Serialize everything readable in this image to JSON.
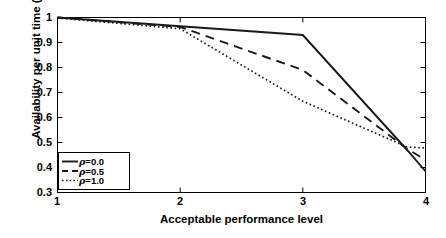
{
  "chart_data": {
    "type": "line",
    "title": "",
    "subtitle": "",
    "xlabel": "Acceptable performance level",
    "ylabel": "Availability per unit time (η_F(T*))",
    "ylabel_parts": {
      "prefix": "Availability per unit time (",
      "eta": "η",
      "sub": "F",
      "mid": "(T",
      "star": "*",
      "suffix": "))"
    },
    "xlim": [
      1,
      4
    ],
    "ylim": [
      0.3,
      1.0
    ],
    "xticks": [
      1,
      2,
      3,
      4
    ],
    "xtick_labels": [
      "1",
      "2",
      "3",
      "4"
    ],
    "yticks": [
      0.3,
      0.4,
      0.5,
      0.6,
      0.7,
      0.8,
      0.9,
      1.0
    ],
    "ytick_labels": [
      "0.3",
      "0.4",
      "0.5",
      "0.6",
      "0.7",
      "0.8",
      "0.9",
      "1"
    ],
    "grid": false,
    "legend_position": "lower-left",
    "line_color": "#000000",
    "background_color": "#ffffff",
    "axis_color": "#000000",
    "x": [
      1,
      2,
      3,
      3.85,
      4
    ],
    "series": [
      {
        "name": "ρ=0.0",
        "label_prefix": "ρ",
        "label_value": "=0.0",
        "style": "solid",
        "dash": "none",
        "values": [
          1.0,
          0.965,
          0.93,
          0.47,
          0.385
        ]
      },
      {
        "name": "ρ=0.5",
        "label_prefix": "ρ",
        "label_value": "=0.5",
        "style": "dashed",
        "dash": "9,6",
        "values": [
          1.0,
          0.962,
          0.79,
          0.475,
          0.43
        ]
      },
      {
        "name": "ρ=1.0",
        "label_prefix": "ρ",
        "label_value": "=1.0",
        "style": "dotted",
        "dash": "1.6,2.6",
        "values": [
          0.998,
          0.955,
          0.665,
          0.482,
          0.478
        ]
      }
    ]
  },
  "legend": {
    "items": [
      {
        "label_prefix": "ρ",
        "label_value": "=0.0",
        "style": "solid"
      },
      {
        "label_prefix": "ρ",
        "label_value": "=0.5",
        "style": "dashed"
      },
      {
        "label_prefix": "ρ",
        "label_value": "=1.0",
        "style": "dotted"
      }
    ]
  }
}
